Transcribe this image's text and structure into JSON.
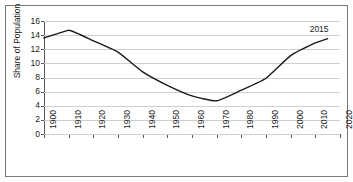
{
  "figure": {
    "cropped_title_text": ""
  },
  "chart_data": {
    "type": "line",
    "title": "",
    "xlabel": "",
    "ylabel": "Share of Population",
    "xlim": [
      1900,
      2020
    ],
    "ylim": [
      0,
      16
    ],
    "grid": true,
    "legend": "none",
    "line_color": "#1a1a1a",
    "gridline_color": "#cfcfcf",
    "axis_color": "#555555",
    "yticks": [
      16,
      14,
      12,
      10,
      8,
      6,
      4,
      2,
      0
    ],
    "xticks": [
      1900,
      1910,
      1920,
      1930,
      1940,
      1950,
      1960,
      1970,
      1980,
      1990,
      2000,
      2010,
      2020
    ],
    "x": [
      1900,
      1910,
      1920,
      1930,
      1940,
      1950,
      1960,
      1970,
      1980,
      1990,
      2000,
      2010,
      2015
    ],
    "values": [
      13.6,
      14.7,
      13.2,
      11.6,
      8.8,
      6.9,
      5.4,
      4.7,
      6.2,
      7.9,
      11.1,
      12.9,
      13.5
    ],
    "annotations": [
      {
        "text": "2015",
        "x": 2015,
        "y": 14.9
      }
    ]
  }
}
